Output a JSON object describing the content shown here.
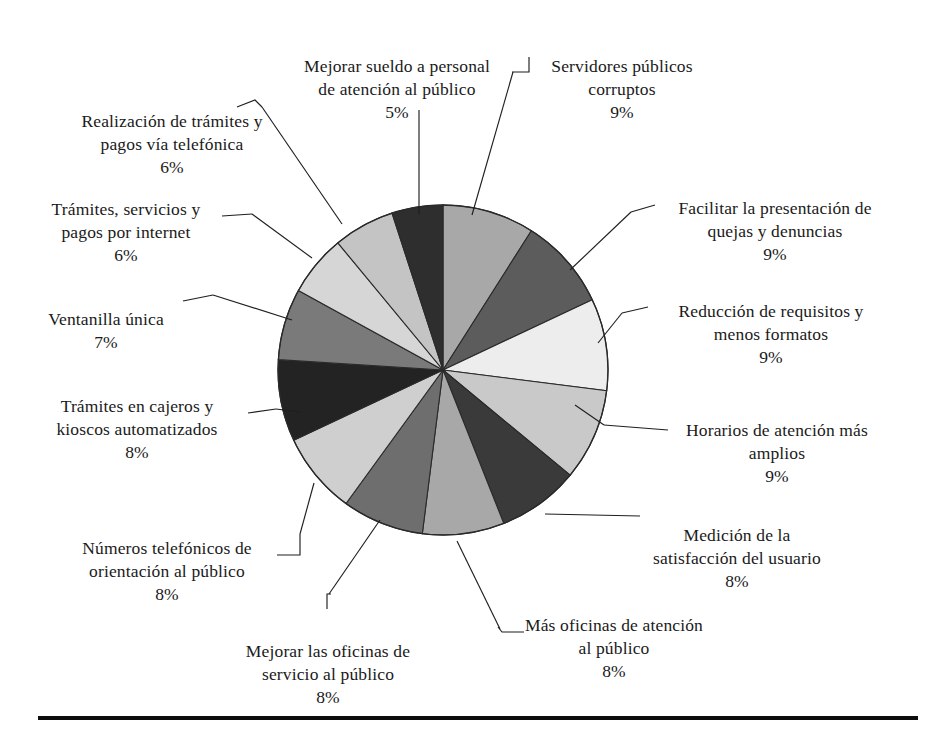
{
  "figure": {
    "background": "#ffffff",
    "text_color": "#1a1a1a",
    "rule_color": "#0d0d0d"
  },
  "chart_data": {
    "type": "pie",
    "title": "",
    "subtitle": "",
    "xlabel": "",
    "ylabel": "",
    "legend_position": "callout-labels",
    "grid": false,
    "value_unit": "%",
    "total": 100,
    "start_angle_deg": 0,
    "direction": "clockwise",
    "center": {
      "x": 443,
      "y": 370
    },
    "radius": 165,
    "categories": [
      "Servidores públicos corruptos",
      "Facilitar la presentación de quejas y denuncias",
      "Reducción de requisitos y menos formatos",
      "Horarios de atención más amplios",
      "Medición de la satisfacción del usuario",
      "Más oficinas de atención al público",
      "Mejorar las oficinas de servicio al público",
      "Números telefónicos de orientación al público",
      "Trámites en cajeros y kioscos automatizados",
      "Ventanilla única",
      "Trámites, servicios y pagos por internet",
      "Realización de trámites y pagos vía telefónica",
      "Mejorar sueldo a personal de atención al público"
    ],
    "values": [
      9,
      9,
      9,
      9,
      8,
      8,
      8,
      8,
      8,
      7,
      6,
      6,
      5
    ],
    "colors": [
      "#a8a8a8",
      "#5c5c5c",
      "#ededed",
      "#c9c9c9",
      "#3a3a3a",
      "#a8a8a8",
      "#6e6e6e",
      "#cfcfcf",
      "#232323",
      "#7a7a7a",
      "#d6d6d6",
      "#c4c4c4",
      "#2e2e2e"
    ],
    "slices": [
      {
        "label": "Servidores públicos corruptos",
        "value": 9,
        "color": "#a8a8a8"
      },
      {
        "label": "Facilitar la presentación de quejas y denuncias",
        "value": 9,
        "color": "#5c5c5c"
      },
      {
        "label": "Reducción de requisitos y menos formatos",
        "value": 9,
        "color": "#ededed"
      },
      {
        "label": "Horarios de atención más amplios",
        "value": 9,
        "color": "#c9c9c9"
      },
      {
        "label": "Medición de la satisfacción del usuario",
        "value": 8,
        "color": "#3a3a3a"
      },
      {
        "label": "Más oficinas de atención al público",
        "value": 8,
        "color": "#a8a8a8"
      },
      {
        "label": "Mejorar las oficinas de servicio al público",
        "value": 8,
        "color": "#6e6e6e"
      },
      {
        "label": "Números telefónicos de orientación al público",
        "value": 8,
        "color": "#cfcfcf"
      },
      {
        "label": "Trámites en cajeros y kioscos automatizados",
        "value": 8,
        "color": "#232323"
      },
      {
        "label": "Ventanilla única",
        "value": 7,
        "color": "#7a7a7a"
      },
      {
        "label": "Trámites, servicios y pagos por internet",
        "value": 6,
        "color": "#d6d6d6"
      },
      {
        "label": "Realización de trámites y pagos vía telefónica",
        "value": 6,
        "color": "#c4c4c4"
      },
      {
        "label": "Mejorar sueldo a personal de atención al público",
        "value": 5,
        "color": "#2e2e2e"
      }
    ]
  },
  "labels": {
    "servidores_publicos_corruptos": {
      "text": "Servidores públicos\ncorruptos",
      "pct": "9%"
    },
    "facilitar_quejas": {
      "text": "Facilitar la presentación de\nquejas y denuncias",
      "pct": "9%"
    },
    "reduccion_requisitos": {
      "text": "Reducción de requisitos y\nmenos formatos",
      "pct": "9%"
    },
    "horarios_atencion": {
      "text": "Horarios de atención más\namplios",
      "pct": "9%"
    },
    "medicion_satisfaccion": {
      "text": "Medición de la\nsatisfacción del usuario",
      "pct": "8%"
    },
    "mas_oficinas": {
      "text": "Más oficinas de atención\nal público",
      "pct": "8%"
    },
    "mejorar_oficinas": {
      "text": "Mejorar las oficinas de\nservicio al público",
      "pct": "8%"
    },
    "numeros_telefonicos": {
      "text": "Números telefónicos de\norientación al público",
      "pct": "8%"
    },
    "tramites_cajeros": {
      "text": "Trámites en cajeros y\nkioscos automatizados",
      "pct": "8%"
    },
    "ventanilla_unica": {
      "text": "Ventanilla única",
      "pct": "7%"
    },
    "tramites_internet": {
      "text": "Trámites, servicios y\npagos por internet",
      "pct": "6%"
    },
    "tramites_telefonica": {
      "text": "Realización de trámites y\npagos vía telefónica",
      "pct": "6%"
    },
    "mejorar_sueldo": {
      "text": "Mejorar sueldo a personal\nde atención al público",
      "pct": "5%"
    }
  }
}
